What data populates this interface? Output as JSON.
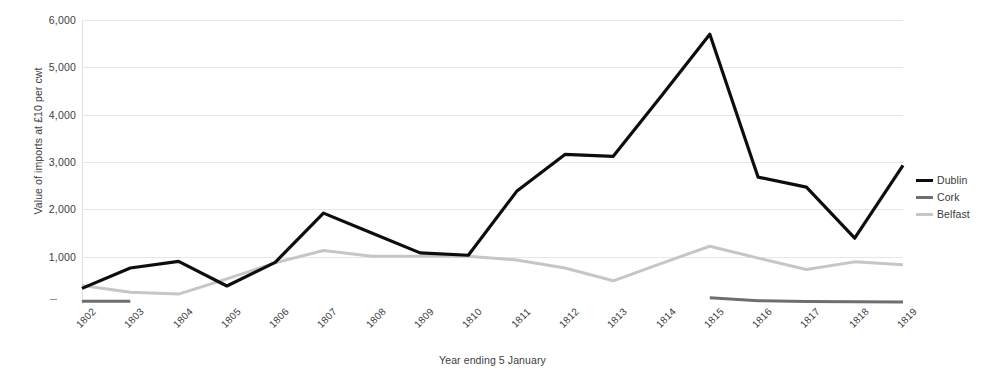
{
  "chart_data": {
    "type": "line",
    "title": "",
    "xlabel": "Year ending 5 January",
    "ylabel": "Value of imports at £10 per cwt",
    "categories": [
      "1802",
      "1803",
      "1804",
      "1805",
      "1806",
      "1807",
      "1808",
      "1809",
      "1810",
      "1811",
      "1812",
      "1813",
      "1814",
      "1815",
      "1816",
      "1817",
      "1818",
      "1819"
    ],
    "ylim": [
      0,
      6000
    ],
    "ytick_labels": [
      "6,000",
      "5,000",
      "4,000",
      "3,000",
      "2,000",
      "1,000",
      "-"
    ],
    "ytick_values": [
      6000,
      5000,
      4000,
      3000,
      2000,
      1000,
      0
    ],
    "grid": "horizontal",
    "legend_position": "right",
    "series": [
      {
        "name": "Dublin",
        "color": "#0d0d0d",
        "values": [
          330,
          760,
          900,
          380,
          880,
          1920,
          1500,
          1080,
          1030,
          2380,
          3160,
          3120,
          4400,
          5700,
          2680,
          2470,
          1390,
          2930
        ]
      },
      {
        "name": "Cork",
        "color": "#6e6e6e",
        "values": [
          60,
          60,
          null,
          null,
          null,
          null,
          null,
          null,
          null,
          null,
          null,
          null,
          null,
          130,
          70,
          55,
          45,
          40
        ]
      },
      {
        "name": "Belfast",
        "color": "#c6c6c6",
        "values": [
          390,
          250,
          210,
          530,
          870,
          1130,
          1010,
          1010,
          1010,
          930,
          760,
          490,
          860,
          1220,
          970,
          730,
          890,
          830
        ]
      }
    ]
  },
  "legend": {
    "items": [
      {
        "label": "Dublin",
        "color": "#0d0d0d"
      },
      {
        "label": "Cork",
        "color": "#6e6e6e"
      },
      {
        "label": "Belfast",
        "color": "#c6c6c6"
      }
    ]
  }
}
